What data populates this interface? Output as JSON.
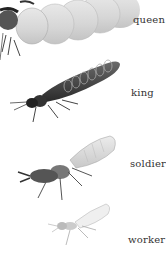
{
  "illustration": {
    "subject": "termite castes",
    "castes": [
      {
        "label": "queen"
      },
      {
        "label": "king"
      },
      {
        "label": "soldier"
      },
      {
        "label": "worker"
      }
    ]
  }
}
